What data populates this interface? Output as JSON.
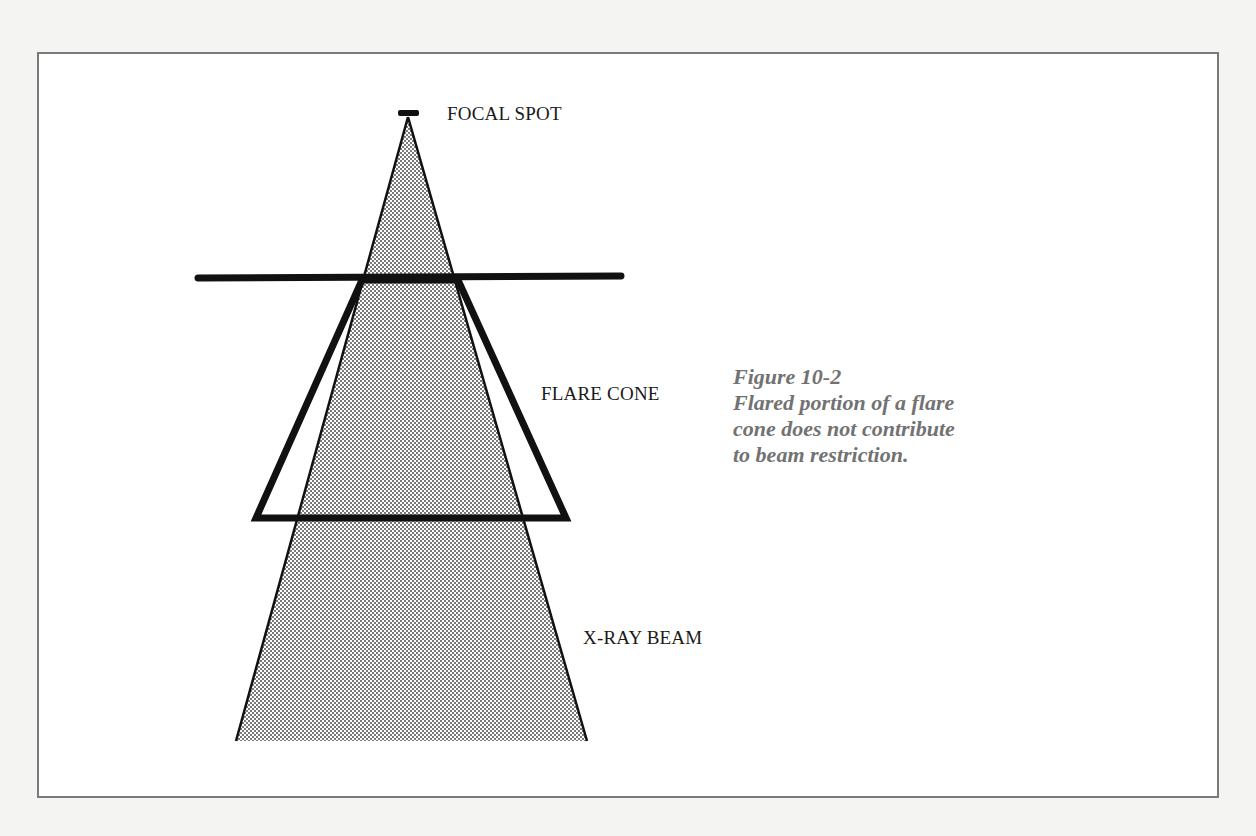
{
  "figure": {
    "number": "Figure 10-2",
    "caption_lines": [
      "Flared portion of a flare",
      "cone does not contribute",
      "to beam restriction."
    ]
  },
  "labels": {
    "focal_spot": "FOCAL SPOT",
    "flare_cone": "FLARE CONE",
    "xray_beam": "X-RAY BEAM"
  },
  "colors": {
    "line": "#111111",
    "beam_dot": "#3a3a3a",
    "caption": "#727272",
    "frame_border": "#7a7a7a"
  }
}
